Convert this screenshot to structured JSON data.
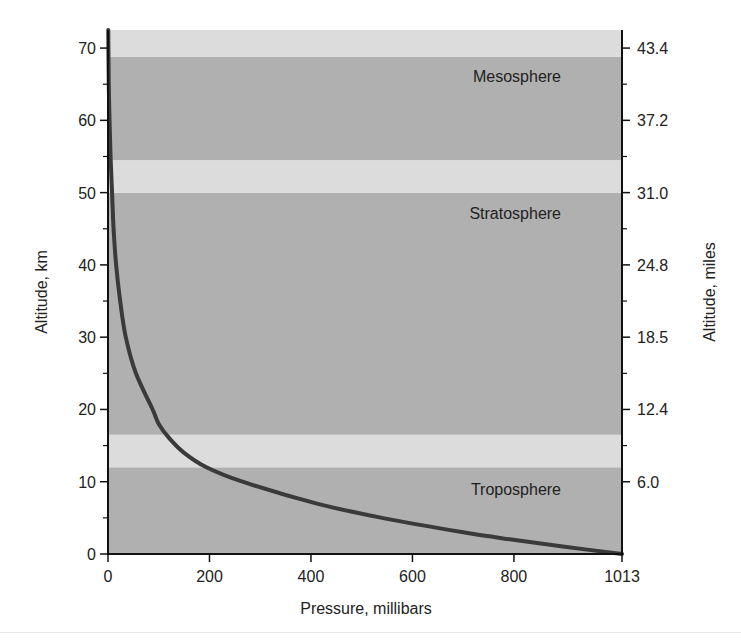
{
  "chart_data": {
    "type": "line",
    "title": "",
    "xlabel": "Pressure, millibars",
    "ylabel": "Altitude, km",
    "ylabel_right": "Altitude, miles",
    "xlim": [
      0,
      1013
    ],
    "ylim": [
      0,
      72.5
    ],
    "x_ticks": [
      0,
      200,
      400,
      600,
      800,
      1013
    ],
    "x_tick_labels": [
      "0",
      "200",
      "400",
      "600",
      "800",
      "1013"
    ],
    "y_ticks": [
      0,
      10,
      20,
      30,
      40,
      50,
      60,
      70
    ],
    "y_tick_labels": [
      "0",
      "10",
      "20",
      "30",
      "40",
      "50",
      "60",
      "70"
    ],
    "y_minor_ticks": [
      5,
      15,
      25,
      35,
      45,
      55,
      65
    ],
    "y_right_ticks_km": [
      10,
      20,
      30,
      40,
      50,
      60,
      70
    ],
    "y_right_tick_labels": [
      "6.0",
      "12.4",
      "18.5",
      "24.8",
      "31.0",
      "37.2",
      "43.4"
    ],
    "y_right_minor_ticks_km": [
      15,
      25,
      35,
      45,
      55,
      65
    ],
    "grid": false,
    "series": [
      {
        "name": "Pressure vs altitude",
        "color": "#3a3a3a",
        "points": [
          {
            "x": 1013,
            "y": 0
          },
          {
            "x": 900,
            "y": 1
          },
          {
            "x": 795,
            "y": 2
          },
          {
            "x": 700,
            "y": 3
          },
          {
            "x": 540,
            "y": 5
          },
          {
            "x": 410,
            "y": 7
          },
          {
            "x": 265,
            "y": 10
          },
          {
            "x": 194,
            "y": 12
          },
          {
            "x": 150,
            "y": 14
          },
          {
            "x": 121,
            "y": 16
          },
          {
            "x": 100,
            "y": 18
          },
          {
            "x": 88,
            "y": 20
          },
          {
            "x": 55,
            "y": 25
          },
          {
            "x": 35,
            "y": 30
          },
          {
            "x": 24,
            "y": 35
          },
          {
            "x": 16,
            "y": 40
          },
          {
            "x": 11,
            "y": 45
          },
          {
            "x": 8,
            "y": 50
          },
          {
            "x": 5,
            "y": 55
          },
          {
            "x": 3,
            "y": 60
          },
          {
            "x": 1.5,
            "y": 65
          },
          {
            "x": 0.5,
            "y": 72.5
          }
        ]
      }
    ],
    "bands": [
      {
        "name": "Troposphere",
        "from": 0,
        "to": 12,
        "shade": "dark"
      },
      {
        "name": "Tropopause",
        "from": 12,
        "to": 16.5,
        "shade": "light"
      },
      {
        "name": "Stratosphere",
        "from": 16.5,
        "to": 50,
        "shade": "dark"
      },
      {
        "name": "Stratopause",
        "from": 50,
        "to": 54.5,
        "shade": "light"
      },
      {
        "name": "Mesosphere",
        "from": 54.5,
        "to": 68.8,
        "shade": "dark"
      },
      {
        "name": "Upper",
        "from": 68.8,
        "to": 72.5,
        "shade": "light"
      }
    ],
    "annotations": [
      {
        "text": "Troposphere",
        "y": 9
      },
      {
        "text": "Stratosphere",
        "y": 47
      },
      {
        "text": "Mesosphere",
        "y": 66
      }
    ]
  },
  "labels": {
    "xlabel": "Pressure, millibars",
    "ylabel_left": "Altitude, km",
    "ylabel_right": "Altitude, miles",
    "layer_troposphere": "Troposphere",
    "layer_stratosphere": "Stratosphere",
    "layer_mesosphere": "Mesosphere"
  },
  "colors": {
    "band_dark": "#b0b0b0",
    "band_light": "#dcdcdc",
    "curve": "#3a3a3a",
    "axis": "#111111",
    "background": "#ffffff"
  }
}
